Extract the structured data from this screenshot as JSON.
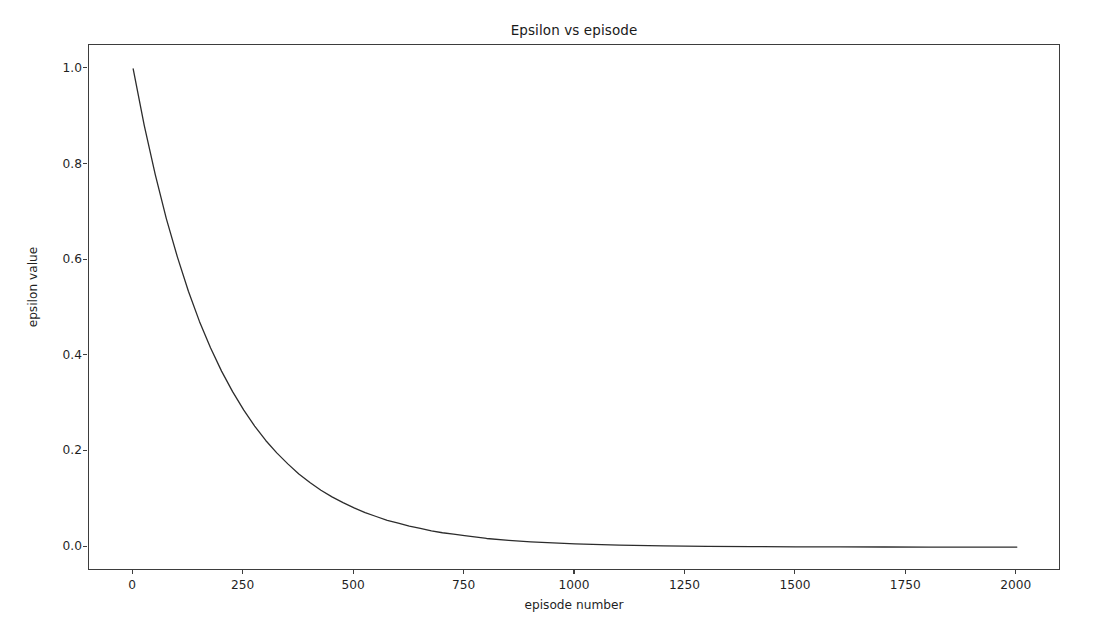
{
  "chart_data": {
    "type": "line",
    "title": "Epsilon vs episode",
    "xlabel": "episode number",
    "ylabel": "epsilon value",
    "xlim": [
      -100,
      2100
    ],
    "ylim": [
      -0.05,
      1.05
    ],
    "grid": false,
    "legend": null,
    "line_color": "#2c2c2c",
    "line_width": 1.3,
    "background_color": "#ffffff",
    "xticks": [
      0,
      250,
      500,
      750,
      1000,
      1250,
      1500,
      1750,
      2000
    ],
    "xtick_labels": [
      "0",
      "250",
      "500",
      "750",
      "1000",
      "1250",
      "1500",
      "1750",
      "2000"
    ],
    "yticks": [
      0.0,
      0.2,
      0.4,
      0.6,
      0.8,
      1.0
    ],
    "ytick_labels": [
      "0.0",
      "0.2",
      "0.4",
      "0.6",
      "0.8",
      "1.0"
    ],
    "series": [
      {
        "name": "epsilon",
        "x": [
          0,
          25,
          50,
          75,
          100,
          125,
          150,
          175,
          200,
          225,
          250,
          275,
          300,
          325,
          350,
          375,
          400,
          425,
          450,
          475,
          500,
          525,
          550,
          575,
          600,
          625,
          650,
          675,
          700,
          725,
          750,
          800,
          850,
          900,
          950,
          1000,
          1100,
          1200,
          1300,
          1400,
          1500,
          1600,
          1700,
          1800,
          1900,
          2000
        ],
        "y": [
          1.0,
          0.882,
          0.779,
          0.687,
          0.607,
          0.535,
          0.472,
          0.417,
          0.368,
          0.325,
          0.287,
          0.253,
          0.223,
          0.197,
          0.174,
          0.153,
          0.135,
          0.119,
          0.105,
          0.093,
          0.082,
          0.072,
          0.064,
          0.056,
          0.05,
          0.044,
          0.039,
          0.034,
          0.03,
          0.027,
          0.024,
          0.018,
          0.014,
          0.011,
          0.009,
          0.0067,
          0.0041,
          0.0025,
          0.0015,
          0.0009,
          0.00055,
          0.00034,
          0.0002,
          0.00012,
          7e-05,
          5e-05
        ]
      }
    ]
  }
}
